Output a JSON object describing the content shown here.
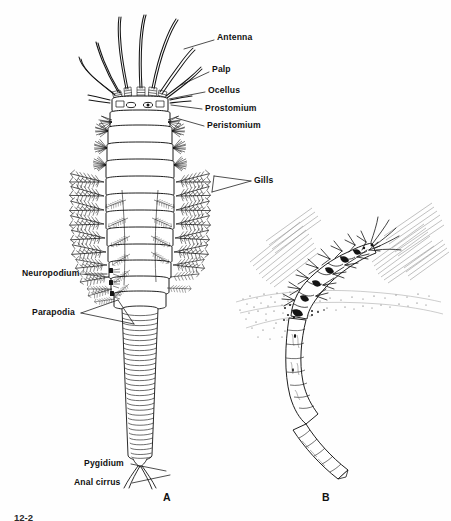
{
  "figure": {
    "type": "anatomical-line-diagram",
    "background_color": "#fefefe",
    "ink_color": "#141414",
    "panels": [
      {
        "id": "A",
        "letter": "A",
        "description": "dorsal view of whole worm showing head appendages, gill-bearing segments and tapering pygidial tail"
      },
      {
        "id": "B",
        "letter": "B",
        "description": "worm in its burrow, anterior end protruding above the sediment surface"
      }
    ],
    "caption_number": "12-2"
  },
  "labels": {
    "right": [
      {
        "id": "antenna",
        "text": "Antenna",
        "x": 217,
        "y": 37,
        "leader": [
          [
            214,
            41
          ],
          [
            185,
            49
          ]
        ]
      },
      {
        "id": "palp",
        "text": "Palp",
        "x": 212,
        "y": 69,
        "leader": [
          [
            209,
            73
          ],
          [
            180,
            85
          ]
        ]
      },
      {
        "id": "ocellus",
        "text": "Ocellus",
        "x": 208,
        "y": 90,
        "leader": [
          [
            205,
            93
          ],
          [
            170,
            99
          ]
        ]
      },
      {
        "id": "prostomium",
        "text": "Prostomium",
        "x": 205,
        "y": 108,
        "leader": [
          [
            202,
            110
          ],
          [
            150,
            104
          ]
        ]
      },
      {
        "id": "peristomium",
        "text": "Peristomium",
        "x": 207,
        "y": 126,
        "leader": [
          [
            204,
            127
          ],
          [
            176,
            117
          ]
        ]
      },
      {
        "id": "gills",
        "text": "Gills",
        "x": 254,
        "y": 180,
        "leader": [
          [
            251,
            183
          ],
          [
            210,
            178
          ]
        ],
        "fork": [
          [
            251,
            183
          ],
          [
            208,
            193
          ]
        ]
      }
    ],
    "left": [
      {
        "id": "neuropodium",
        "text": "Neuropodium",
        "x": 22,
        "y": 272,
        "leader": [
          [
            84,
            276
          ],
          [
            110,
            276
          ]
        ]
      },
      {
        "id": "parapodia",
        "text": "Parapodia",
        "x": 32,
        "y": 312,
        "leader": [
          [
            80,
            315
          ],
          [
            116,
            303
          ]
        ],
        "fork": [
          [
            80,
            315
          ],
          [
            132,
            325
          ]
        ]
      },
      {
        "id": "pygidium",
        "text": "Pygidium",
        "x": 84,
        "y": 463,
        "leader": [
          [
            130,
            466
          ],
          [
            166,
            472
          ]
        ]
      },
      {
        "id": "anal_cirrus",
        "text": "Anal cirrus",
        "x": 74,
        "y": 482,
        "leader": [
          [
            130,
            484
          ],
          [
            168,
            476
          ]
        ]
      }
    ]
  },
  "panel_letters": [
    {
      "letter": "A",
      "x": 163,
      "y": 492
    },
    {
      "letter": "B",
      "x": 322,
      "y": 492
    }
  ],
  "caption": {
    "text": "12-2",
    "x": 14,
    "y": 512
  }
}
